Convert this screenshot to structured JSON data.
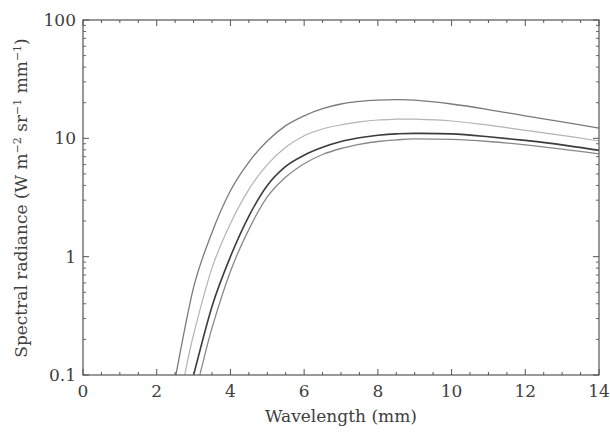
{
  "chart_data": {
    "type": "line",
    "title": "",
    "xlabel": "Wavelength (mm)",
    "ylabel": "Spectral radiance (W m⁻² sr⁻¹ mm⁻¹)",
    "xlim": [
      0,
      14
    ],
    "ylim": [
      0.1,
      100
    ],
    "yscale": "log",
    "grid": false,
    "legend": null,
    "x_ticks": [
      "0",
      "2",
      "4",
      "6",
      "8",
      "10",
      "12",
      "14"
    ],
    "y_ticks": [
      "0.1",
      "1",
      "10",
      "100"
    ],
    "series": [
      {
        "name": "curve-1",
        "color": "#7a7a7a",
        "width": 1.3,
        "x": [
          2.52,
          3,
          3.5,
          4,
          4.5,
          5,
          5.5,
          6,
          6.5,
          7,
          7.5,
          8,
          8.5,
          9,
          10,
          11,
          12,
          13,
          14
        ],
        "values": [
          0.1,
          0.55,
          1.6,
          3.6,
          6.3,
          9.5,
          12.8,
          15.5,
          17.8,
          19.5,
          20.5,
          21,
          21.2,
          21,
          19.5,
          17.5,
          15.5,
          13.8,
          12.2
        ]
      },
      {
        "name": "curve-2",
        "color": "#b4b4b4",
        "width": 1.2,
        "x": [
          2.76,
          3,
          3.5,
          4,
          4.5,
          5,
          5.5,
          6,
          6.5,
          7,
          7.5,
          8,
          8.5,
          9,
          10,
          11,
          12,
          13,
          14
        ],
        "values": [
          0.1,
          0.22,
          0.8,
          1.9,
          3.7,
          6.0,
          8.4,
          10.5,
          12.0,
          13.0,
          13.8,
          14.3,
          14.5,
          14.5,
          14.0,
          12.9,
          11.7,
          10.6,
          9.5
        ]
      },
      {
        "name": "curve-3",
        "color": "#3c3c3c",
        "width": 1.6,
        "x": [
          3.0,
          3.5,
          4,
          4.5,
          5,
          5.5,
          6,
          6.5,
          7,
          7.5,
          8,
          8.5,
          9,
          10,
          11,
          12,
          13,
          14
        ],
        "values": [
          0.1,
          0.38,
          1.0,
          2.2,
          4.0,
          5.8,
          7.2,
          8.4,
          9.4,
          10.1,
          10.6,
          10.9,
          11.0,
          10.9,
          10.3,
          9.6,
          8.8,
          7.9
        ]
      },
      {
        "name": "curve-4",
        "color": "#888888",
        "width": 1.3,
        "x": [
          3.17,
          3.5,
          4,
          4.5,
          5,
          5.5,
          6,
          6.5,
          7,
          7.5,
          8,
          8.5,
          9,
          10,
          11,
          12,
          13,
          14
        ],
        "values": [
          0.1,
          0.25,
          0.75,
          1.7,
          3.2,
          4.7,
          6.1,
          7.3,
          8.2,
          8.9,
          9.4,
          9.7,
          9.9,
          9.8,
          9.4,
          8.8,
          8.1,
          7.4
        ]
      }
    ]
  },
  "labels": {
    "xlabel": "Wavelength (mm)",
    "ylabel_main": "Spectral radiance (W m",
    "ylabel_sup1": "−2",
    "ylabel_mid": " sr",
    "ylabel_sup2": "−1",
    "ylabel_mid2": " mm",
    "ylabel_sup3": "−1",
    "ylabel_end": ")"
  }
}
